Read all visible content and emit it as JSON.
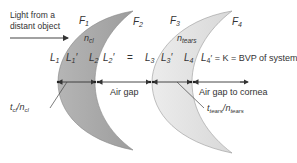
{
  "diagram": {
    "incoming_light_label_line1": "Light from a",
    "incoming_light_label_line2": "distant object",
    "surfaces": {
      "f1": "F",
      "f1_sub": "1",
      "f2": "F",
      "f2_sub": "2",
      "f3": "F",
      "f3_sub": "3",
      "f4": "F",
      "f4_sub": "4"
    },
    "indices": {
      "lens1": "n",
      "lens1_sub": "cl",
      "lens2": "n",
      "lens2_sub": "tears"
    },
    "vergences": {
      "l1": "L",
      "l1_sub": "1",
      "l1p": "L",
      "l1p_sub": "1",
      "l1p_prime": "′",
      "l2": "L",
      "l2_sub": "2",
      "l2p": "L",
      "l2p_sub": "2",
      "l2p_prime": "′",
      "equals": "=",
      "l3": "L",
      "l3_sub": "3",
      "l3p": "L",
      "l3p_sub": "3",
      "l3p_prime": "′",
      "l4": "L",
      "l4_sub": "4",
      "l4p": "L",
      "l4p_sub": "4",
      "l4p_prime": "′",
      "result_text": " = K = BVP of system"
    },
    "gaps": {
      "air_gap": "Air gap",
      "air_gap_cornea": "Air gap to cornea"
    },
    "thickness": {
      "lens1_t": "t",
      "lens1_t_sub": "cl",
      "lens1_slash": "/",
      "lens1_n": "n",
      "lens1_n_sub": "cl",
      "lens2_t": "t",
      "lens2_t_sub": "tears",
      "lens2_slash": "/",
      "lens2_n": "n",
      "lens2_n_sub": "tears"
    },
    "colors": {
      "lens1_fill": "#aaaaaa",
      "lens2_fill": "#e2e2e2",
      "stroke": "#555555",
      "text": "#333333"
    }
  }
}
